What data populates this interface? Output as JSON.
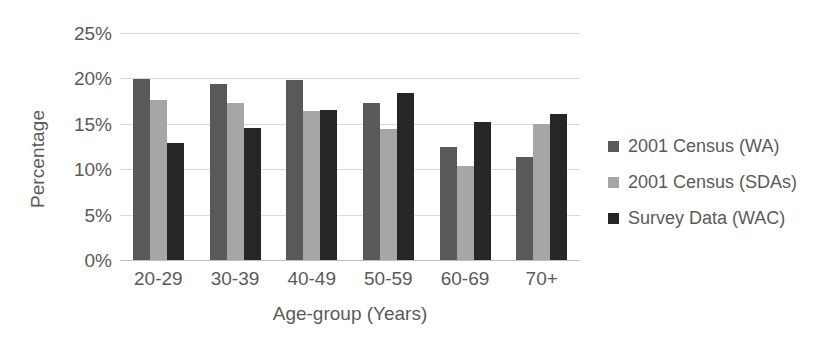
{
  "chart_data": {
    "type": "bar",
    "title": "",
    "xlabel": "Age-group (Years)",
    "ylabel": "Percentage",
    "categories": [
      "20-29",
      "30-39",
      "40-49",
      "50-59",
      "60-69",
      "70+"
    ],
    "series": [
      {
        "name": "2001 Census (WA)",
        "color": "#595959",
        "values": [
          19.9,
          19.4,
          19.8,
          17.3,
          12.5,
          11.4
        ]
      },
      {
        "name": "2001 Census (SDAs)",
        "color": "#a6a6a6",
        "values": [
          17.6,
          17.3,
          16.4,
          14.4,
          10.3,
          15.0
        ]
      },
      {
        "name": "Survey Data (WAC)",
        "color": "#262626",
        "values": [
          12.9,
          14.5,
          16.5,
          18.4,
          15.2,
          16.1
        ]
      }
    ],
    "ylim": [
      0,
      25
    ],
    "ytick_values": [
      0,
      5,
      10,
      15,
      20,
      25
    ],
    "ytick_labels": [
      "0%",
      "5%",
      "10%",
      "15%",
      "20%",
      "25%"
    ],
    "grid": true,
    "grid_color": "#d9d9d9",
    "legend_position": "right",
    "background": "#ffffff",
    "text_color": "#595959"
  }
}
